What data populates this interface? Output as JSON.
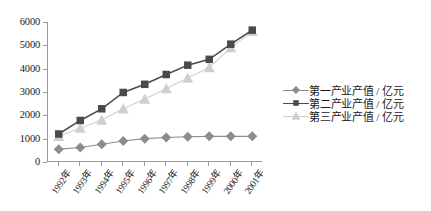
{
  "chart_data": {
    "type": "line",
    "title": "",
    "subtitle": "",
    "xlabel": "",
    "ylabel": "",
    "ylim": [
      0,
      6000
    ],
    "yticks": [
      0,
      1000,
      2000,
      3000,
      4000,
      5000,
      6000
    ],
    "grid": false,
    "legend_position": "right",
    "categories": [
      "1992年",
      "1993年",
      "1994年",
      "1995年",
      "1996年",
      "1997年",
      "1998年",
      "1999年",
      "2000年",
      "2001年"
    ],
    "series": [
      {
        "name": "第一产业产值 / 亿元",
        "marker": "diamond",
        "color": "#8c8c8c",
        "values": [
          550,
          620,
          760,
          900,
          1000,
          1050,
          1080,
          1100,
          1100,
          1100
        ]
      },
      {
        "name": "第二产业产值 / 亿元",
        "marker": "square",
        "color": "#4a4a4a",
        "values": [
          1200,
          1780,
          2280,
          2980,
          3330,
          3750,
          4150,
          4400,
          5050,
          5650
        ]
      },
      {
        "name": "第三产业产值 / 亿元",
        "marker": "triangle",
        "color": "#cfcfcf",
        "values": [
          1100,
          1450,
          1800,
          2280,
          2700,
          3150,
          3600,
          4050,
          4900,
          5600
        ]
      }
    ]
  },
  "legend": {
    "items": [
      {
        "label": "第一产业产值 / 亿元"
      },
      {
        "label": "第二产业产值 / 亿元"
      },
      {
        "label": "第三产业产值 / 亿元"
      }
    ]
  },
  "axis": {
    "y_tick_labels": [
      "6000",
      "5000",
      "4000",
      "3000",
      "2000",
      "1000",
      "0"
    ],
    "x_tick_labels": [
      "1992年",
      "1993年",
      "1994年",
      "1995年",
      "1996年",
      "1997年",
      "1998年",
      "1999年",
      "2000年",
      "2001年"
    ]
  },
  "colors": {
    "axis": "#9a9a9a",
    "text": "#1a1a1a",
    "background": "#ffffff"
  }
}
